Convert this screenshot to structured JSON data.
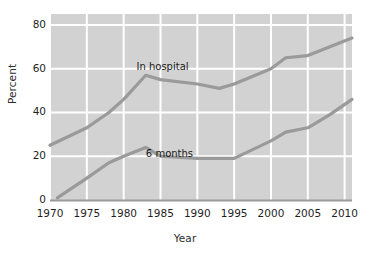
{
  "chart_data": {
    "type": "line",
    "title": "",
    "xlabel": "Year",
    "ylabel": "Percent",
    "xlim": [
      1970,
      2011
    ],
    "ylim": [
      0,
      85
    ],
    "xticks": [
      1970,
      1975,
      1980,
      1985,
      1990,
      1995,
      2000,
      2005,
      2010
    ],
    "yticks": [
      0,
      20,
      40,
      60,
      80
    ],
    "grid": true,
    "legend_position": "inline-annotation",
    "plot_background": "#d2d2d2",
    "grid_color": "#ffffff",
    "line_color": "#9a9a9a",
    "series": [
      {
        "name": "In hospital",
        "label_x": 1985,
        "label_y": 61,
        "x": [
          1970,
          1975,
          1978,
          1980,
          1983,
          1985,
          1990,
          1993,
          1995,
          2000,
          2002,
          2005,
          2008,
          2011
        ],
        "values": [
          25,
          33,
          40,
          46,
          57,
          55,
          53,
          51,
          53,
          60,
          65,
          66,
          70,
          74
        ]
      },
      {
        "name": "6 months",
        "label_x": 1986,
        "label_y": 21,
        "x": [
          1971,
          1975,
          1978,
          1980,
          1983,
          1985,
          1990,
          1995,
          2000,
          2002,
          2005,
          2008,
          2011
        ],
        "values": [
          1,
          10,
          17,
          20,
          24,
          20,
          19,
          19,
          27,
          31,
          33,
          39,
          46
        ]
      }
    ]
  },
  "axis": {
    "y_title": "Percent",
    "x_title": "Year",
    "y_tick_labels": [
      "80",
      "60",
      "40",
      "20",
      "0"
    ],
    "x_tick_labels": [
      "1970",
      "1975",
      "1980",
      "1985",
      "1990",
      "1995",
      "2000",
      "2005",
      "2010"
    ]
  },
  "annotations": {
    "in_hospital": "In hospital",
    "six_months": "6 months"
  }
}
